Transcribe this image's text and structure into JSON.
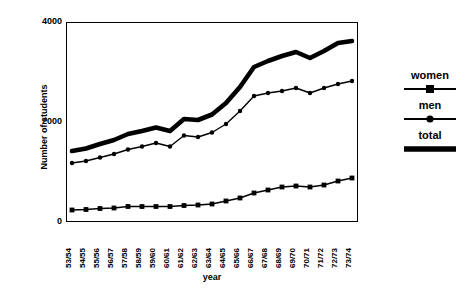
{
  "chart_data": {
    "type": "line",
    "title": "",
    "xlabel": "year",
    "ylabel": "Number of students",
    "ylim": [
      0,
      4000
    ],
    "y_ticks": [
      0,
      2000,
      4000
    ],
    "grid": false,
    "legend_position": "right",
    "categories": [
      "53/54",
      "54/55",
      "55/56",
      "56/57",
      "57/58",
      "58/59",
      "59/60",
      "60/61",
      "61/62",
      "62/63",
      "63/64",
      "64/65",
      "65/66",
      "66/67",
      "67/68",
      "68/69",
      "69/70",
      "70/71",
      "71/72",
      "72/73",
      "73/74"
    ],
    "series": [
      {
        "name": "women",
        "marker": "square",
        "values": [
          240,
          250,
          270,
          280,
          310,
          310,
          310,
          310,
          330,
          340,
          360,
          420,
          480,
          580,
          640,
          700,
          720,
          700,
          740,
          820,
          880
        ]
      },
      {
        "name": "men",
        "marker": "circle",
        "values": [
          1180,
          1220,
          1290,
          1360,
          1450,
          1510,
          1580,
          1510,
          1730,
          1700,
          1790,
          1960,
          2220,
          2520,
          2580,
          2620,
          2680,
          2580,
          2680,
          2760,
          2820
        ]
      },
      {
        "name": "total",
        "marker": "none",
        "values": [
          1420,
          1470,
          1560,
          1640,
          1760,
          1820,
          1890,
          1820,
          2060,
          2040,
          2150,
          2380,
          2700,
          3100,
          3220,
          3320,
          3400,
          3280,
          3420,
          3580,
          3620
        ]
      }
    ]
  },
  "axes": {
    "y_tick_labels": [
      "4000",
      "2000",
      "0"
    ],
    "y_axis_title": "Number of students",
    "x_axis_title": "year"
  },
  "legend": {
    "entries": [
      {
        "label": "women",
        "marker": "square-marker"
      },
      {
        "label": "men",
        "marker": "circle-marker"
      },
      {
        "label": "total",
        "marker": "thick-line"
      }
    ]
  },
  "colors": {
    "line": "#000000",
    "background": "#ffffff",
    "frame": "#000000"
  }
}
